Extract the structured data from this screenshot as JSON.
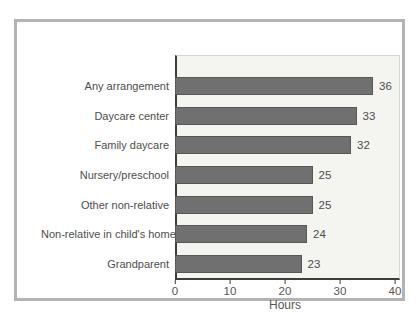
{
  "chart_data": {
    "type": "bar",
    "orientation": "horizontal",
    "categories": [
      "Any arrangement",
      "Daycare center",
      "Family daycare",
      "Nursery/preschool",
      "Other non-relative",
      "Non-relative in child's home",
      "Grandparent"
    ],
    "values": [
      36,
      33,
      32,
      25,
      25,
      24,
      23
    ],
    "title": "",
    "xlabel": "Hours",
    "ylabel": "",
    "xlim": [
      0,
      40
    ],
    "xticks": [
      0,
      10,
      20,
      30,
      40
    ],
    "value_labels_shown": true,
    "grid": false,
    "legend": "none",
    "bar_color": "#707070",
    "bar_border_color": "#575757",
    "plot_background": "#f4f4f1",
    "frame_border_color": "#b3b3b3",
    "axis_color": "#3d3d3d",
    "text_color": "#4d4d4d"
  }
}
